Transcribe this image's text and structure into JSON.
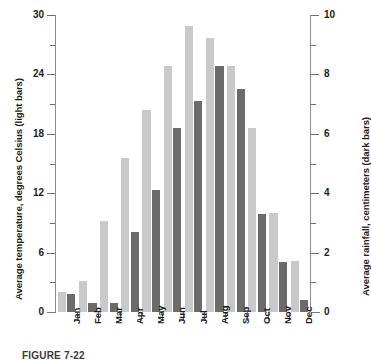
{
  "chart_data": {
    "type": "bar",
    "title": "",
    "subtitle": "",
    "xlabel": "",
    "ylabel": "Average temperature, degrees Celsius (light bars)",
    "y2label": "Average rainfall, centimeters (dark bars)",
    "categories": [
      "Jan",
      "Feb",
      "Mar",
      "Apr",
      "May",
      "Jun",
      "Jul",
      "Aug",
      "Sep",
      "Oct",
      "Nov",
      "Dec"
    ],
    "series": [
      {
        "name": "Average temperature, degrees Celsius (light bars)",
        "axis": "left",
        "color": "#c9c9c9",
        "units": "degrees Celsius",
        "values": [
          2.0,
          3.1,
          9.2,
          15.6,
          20.4,
          24.9,
          28.9,
          27.7,
          24.8,
          18.6,
          10.0,
          5.2
        ]
      },
      {
        "name": "Average rainfall, centimeters (dark bars)",
        "axis": "right",
        "color": "#6b6b6b",
        "units": "centimeters",
        "values": [
          0.6,
          0.3,
          0.3,
          2.7,
          4.1,
          6.2,
          7.1,
          8.3,
          7.5,
          3.3,
          1.7,
          0.4
        ]
      }
    ],
    "ylim": [
      0,
      30
    ],
    "yticks": [
      0,
      6,
      12,
      18,
      24,
      30
    ],
    "yminorticks": [
      3,
      9,
      15,
      21,
      27
    ],
    "y2lim": [
      0,
      10
    ],
    "y2ticks": [
      0,
      2,
      4,
      6,
      8,
      10
    ],
    "y2minorticks": [
      1,
      3,
      5,
      7,
      9
    ],
    "grid": false,
    "legend": "none",
    "legend_note": "Light bars = average temperature; dark bars = average rainfall"
  },
  "axes": {
    "left_title": "Average temperature, degrees Celsius (light bars)",
    "right_title": "Average rainfall, centimeters (dark bars)",
    "left_tick_labels": [
      "0",
      "6",
      "12",
      "18",
      "24",
      "30"
    ],
    "right_tick_labels": [
      "0",
      "2",
      "4",
      "6",
      "8",
      "10"
    ]
  },
  "caption": {
    "text": "FIGURE 7-22"
  }
}
